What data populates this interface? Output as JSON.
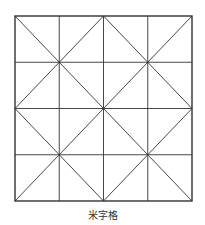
{
  "diagram": {
    "name": "mi-zi-ge grid",
    "rows": 4,
    "columns": 4,
    "diagonals": "each 2x2 quadrant crossed by both diagonals",
    "line_color": "#333333",
    "background_color": "#ffffff"
  },
  "caption": "米字格"
}
